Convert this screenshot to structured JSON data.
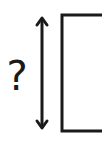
{
  "diagram": {
    "unknown_symbol": "?",
    "stroke_color": "#1a1a1a",
    "background_color": "#ffffff",
    "elements": [
      {
        "name": "question-mark",
        "text": "?"
      },
      {
        "name": "double-headed-arrow",
        "orientation": "vertical"
      },
      {
        "name": "bracket",
        "opening": "right"
      }
    ]
  }
}
